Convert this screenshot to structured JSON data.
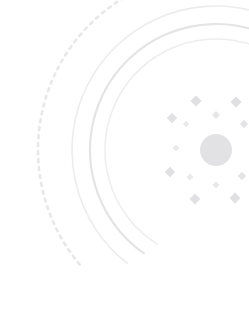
{
  "figure": {
    "width": 249,
    "height": 327,
    "background_color": "#ffffff"
  },
  "chart_data": {
    "type": "scatter",
    "title": "",
    "subtitle": "",
    "xlabel": "",
    "ylabel": "",
    "grid": false,
    "legend_position": "none",
    "xlim": [
      0,
      249
    ],
    "ylim": [
      0,
      327
    ],
    "center": {
      "x": 216,
      "y": 150
    },
    "rings": [
      {
        "name": "ring-1-dashed",
        "radius": 178,
        "stroke": "#e8e8ea",
        "width": 2.6,
        "style": "dashed",
        "dash": "3 5"
      },
      {
        "name": "ring-2-solid",
        "radius": 144,
        "stroke": "#ececed",
        "width": 1.6,
        "style": "solid",
        "dash": ""
      },
      {
        "name": "ring-3-solid",
        "radius": 126,
        "stroke": "#e4e4e6",
        "width": 2.2,
        "style": "solid",
        "dash": ""
      },
      {
        "name": "ring-4-solid",
        "radius": 111,
        "stroke": "#ededee",
        "width": 1.5,
        "style": "solid",
        "dash": ""
      }
    ],
    "core": {
      "name": "core-disc",
      "cx": 216,
      "cy": 150,
      "r": 16,
      "fill": "#e2e2e4"
    },
    "markers": [
      {
        "name": "marker-n",
        "x": 216,
        "y": 115,
        "size": 4.0,
        "shape": "diamond",
        "fill": "#e6e6e8"
      },
      {
        "name": "marker-nne",
        "x": 236,
        "y": 102,
        "size": 5.6,
        "shape": "diamond",
        "fill": "#e0e0e3"
      },
      {
        "name": "marker-nnw",
        "x": 196,
        "y": 101,
        "size": 5.6,
        "shape": "diamond",
        "fill": "#e0e0e3"
      },
      {
        "name": "marker-nw",
        "x": 172,
        "y": 118,
        "size": 5.2,
        "shape": "diamond",
        "fill": "#e2e2e5"
      },
      {
        "name": "marker-wnw",
        "x": 186,
        "y": 124,
        "size": 3.2,
        "shape": "diamond",
        "fill": "#eaeaec"
      },
      {
        "name": "marker-w",
        "x": 176,
        "y": 148,
        "size": 3.4,
        "shape": "diamond",
        "fill": "#e9e9eb"
      },
      {
        "name": "marker-wsw",
        "x": 170,
        "y": 172,
        "size": 5.2,
        "shape": "diamond",
        "fill": "#e1e1e4"
      },
      {
        "name": "marker-sw",
        "x": 190,
        "y": 177,
        "size": 3.4,
        "shape": "diamond",
        "fill": "#eaeaec"
      },
      {
        "name": "marker-ssw",
        "x": 195,
        "y": 199,
        "size": 5.4,
        "shape": "diamond",
        "fill": "#e1e1e4"
      },
      {
        "name": "marker-s",
        "x": 216,
        "y": 185,
        "size": 3.6,
        "shape": "diamond",
        "fill": "#e9e9eb"
      },
      {
        "name": "marker-sse",
        "x": 235,
        "y": 198,
        "size": 5.4,
        "shape": "diamond",
        "fill": "#e0e0e3"
      },
      {
        "name": "marker-ese",
        "x": 242,
        "y": 176,
        "size": 4.2,
        "shape": "diamond",
        "fill": "#e4e4e7"
      },
      {
        "name": "marker-ene",
        "x": 244,
        "y": 124,
        "size": 4.2,
        "shape": "diamond",
        "fill": "#e4e4e7"
      }
    ],
    "arc_sweeps": {
      "ring-1-dashed": {
        "start_deg": 140,
        "end_deg": 272
      },
      "ring-2-solid": {
        "start_deg": 128,
        "end_deg": 285
      },
      "ring-3-solid": {
        "start_deg": 125,
        "end_deg": 288
      },
      "ring-4-solid": {
        "start_deg": 122,
        "end_deg": 292
      }
    }
  }
}
